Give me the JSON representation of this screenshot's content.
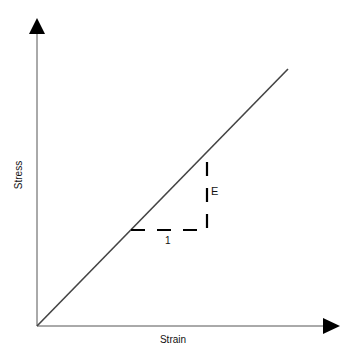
{
  "diagram": {
    "x_axis_label": "Strain",
    "y_axis_label": "Stress",
    "slope_label": "E",
    "run_label": "1",
    "colors": {
      "line": "#444444",
      "axis": "#555555",
      "arrow": "#000000",
      "dash": "#000000"
    }
  }
}
